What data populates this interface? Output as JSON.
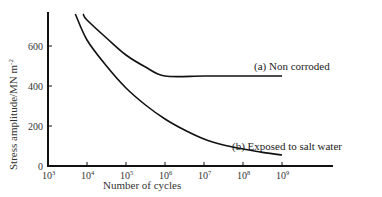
{
  "chart_data": {
    "type": "line",
    "title": "",
    "xlabel": "Number of cycles",
    "ylabel": "Stress amplitude/MN m",
    "ylabel_superscript": "-2",
    "xscale": "log",
    "xlim_exp": [
      3,
      10.3
    ],
    "ylim": [
      0,
      770
    ],
    "grid": false,
    "legend": "inline annotations",
    "x_ticks": [
      {
        "exp": 3,
        "label": "10",
        "sup": "3"
      },
      {
        "exp": 4,
        "label": "10",
        "sup": "4"
      },
      {
        "exp": 5,
        "label": "10",
        "sup": "5"
      },
      {
        "exp": 6,
        "label": "10",
        "sup": "6"
      },
      {
        "exp": 7,
        "label": "10",
        "sup": "7"
      },
      {
        "exp": 8,
        "label": "10",
        "sup": "8"
      },
      {
        "exp": 9,
        "label": "10",
        "sup": "9"
      }
    ],
    "y_ticks": [
      0,
      200,
      400,
      600
    ],
    "series": [
      {
        "name": "(a) Non corroded",
        "x_exp": [
          3.9,
          4,
          4.5,
          5,
          5.5,
          6,
          7,
          8,
          9
        ],
        "values": [
          760,
          730,
          640,
          555,
          495,
          450,
          450,
          450,
          450
        ]
      },
      {
        "name": "(b) Exposed to salt water",
        "x_exp": [
          3.7,
          4,
          4.5,
          5,
          5.5,
          6,
          6.5,
          7,
          7.5,
          8,
          8.5,
          9
        ],
        "values": [
          760,
          630,
          500,
          390,
          305,
          235,
          180,
          135,
          105,
          85,
          68,
          55
        ]
      }
    ],
    "annotations": [
      {
        "text": "(a) Non corroded",
        "x_exp": 8.0,
        "y": 455
      },
      {
        "text": "(b) Exposed to salt water",
        "x_exp": 7.0,
        "y": 110
      }
    ]
  },
  "labels": {
    "ylabel_main": "Stress amplitude/MN m",
    "ylabel_sup": "-2",
    "xlabel": "Number of cycles",
    "annot_a": "(a) Non corroded",
    "annot_b": "(b) Exposed to salt water"
  }
}
